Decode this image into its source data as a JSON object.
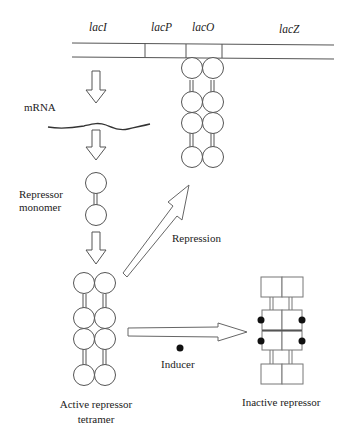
{
  "figure": {
    "genes": [
      {
        "id": "lacI",
        "label": "lacI"
      },
      {
        "id": "lacP",
        "label": "lacP"
      },
      {
        "id": "lacO",
        "label": "lacO"
      },
      {
        "id": "lacZ",
        "label": "lacZ"
      }
    ],
    "labels": {
      "mrna": "mRNA",
      "monomer_line1": "Repressor",
      "monomer_line2": "monomer",
      "repression": "Repression",
      "inducer": "Inducer",
      "active_line1": "Active repressor",
      "active_line2": "tetramer",
      "inactive": "Inactive repressor"
    },
    "colors": {
      "line": "#555555",
      "text": "#222222",
      "inducer_dot": "#111111",
      "background": "#ffffff"
    }
  }
}
